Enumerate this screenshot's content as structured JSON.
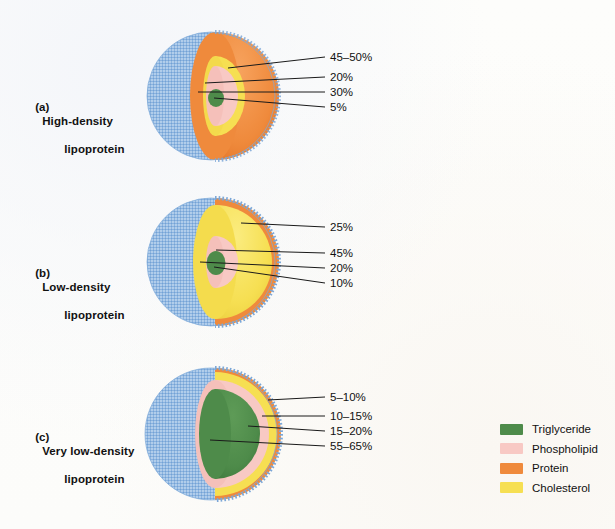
{
  "figure": {
    "background": "#fdfdfb",
    "colors": {
      "triglyceride": "#4e8b4a",
      "triglyceride_dark": "#3f7a3c",
      "phospholipid": "#f8c9c4",
      "phospholipid_dark": "#efb2ac",
      "protein": "#ef8a3c",
      "protein_dark": "#e06f25",
      "cholesterol": "#f6df52",
      "cholesterol_dark": "#e8c93a",
      "shell_blue": "#8db6e0",
      "shell_blue_dark": "#6f9fd4",
      "leader_line": "#1a1a1a"
    }
  },
  "panels": [
    {
      "id": "hdl",
      "marker": "(a)",
      "title_line1": "High-density",
      "title_line2": "lipoprotein",
      "labels": [
        {
          "value": "45–50%",
          "component": "protein"
        },
        {
          "value": "20%",
          "component": "cholesterol"
        },
        {
          "value": "30%",
          "component": "phospholipid"
        },
        {
          "value": "5%",
          "component": "triglyceride"
        }
      ]
    },
    {
      "id": "ldl",
      "marker": "(b)",
      "title_line1": "Low-density",
      "title_line2": "lipoprotein",
      "labels": [
        {
          "value": "25%",
          "component": "protein"
        },
        {
          "value": "45%",
          "component": "cholesterol"
        },
        {
          "value": "20%",
          "component": "phospholipid"
        },
        {
          "value": "10%",
          "component": "triglyceride"
        }
      ]
    },
    {
      "id": "vldl",
      "marker": "(c)",
      "title_line1": "Very low-density",
      "title_line2": "lipoprotein",
      "labels": [
        {
          "value": "5–10%",
          "component": "protein"
        },
        {
          "value": "10–15%",
          "component": "cholesterol"
        },
        {
          "value": "15–20%",
          "component": "phospholipid"
        },
        {
          "value": "55–65%",
          "component": "triglyceride"
        }
      ]
    }
  ],
  "legend": {
    "items": [
      {
        "label": "Triglyceride",
        "color": "#4e8b4a"
      },
      {
        "label": "Phospholipid",
        "color": "#f8c9c4"
      },
      {
        "label": "Protein",
        "color": "#ef8a3c"
      },
      {
        "label": "Cholesterol",
        "color": "#f6df52"
      }
    ]
  }
}
